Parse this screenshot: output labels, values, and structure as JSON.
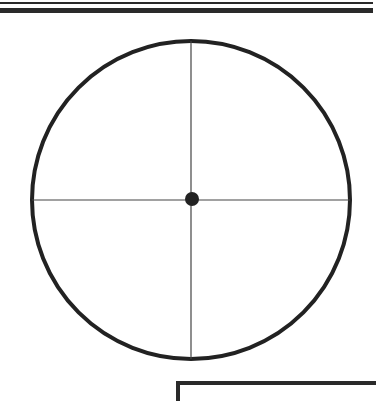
{
  "diagram": {
    "shapes": {
      "outer_circle": "circle",
      "crosshair": [
        "vertical-line",
        "horizontal-line"
      ],
      "center_point": "dot"
    },
    "colors": {
      "stroke": "#222222",
      "background": "#ffffff"
    }
  }
}
